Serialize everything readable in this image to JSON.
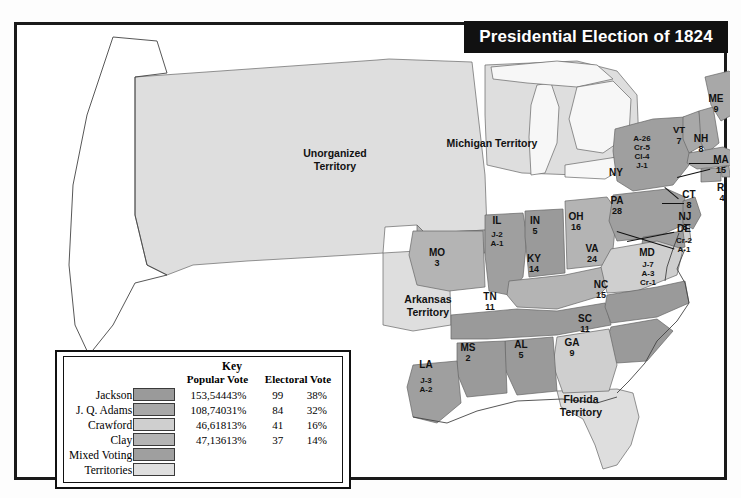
{
  "running_head": "",
  "map": {
    "title": "Presidential Election of 1824",
    "territories": [
      {
        "name": "Unorganized\nTerritory",
        "line1": "Unorganized",
        "line2": "Territory"
      },
      {
        "name": "Michigan Territory",
        "line1": "Michigan Territory",
        "line2": ""
      },
      {
        "name": "Arkansas Territory",
        "line1": "Arkansas",
        "line2": "Territory"
      },
      {
        "name": "Florida Territory",
        "line1": "Florida",
        "line2": "Territory"
      }
    ],
    "states": [
      {
        "abbr": "ME",
        "electoral": "9",
        "breakdown": []
      },
      {
        "abbr": "VT",
        "electoral": "7",
        "breakdown": []
      },
      {
        "abbr": "NH",
        "electoral": "8",
        "breakdown": []
      },
      {
        "abbr": "MA",
        "electoral": "15",
        "breakdown": []
      },
      {
        "abbr": "RI",
        "electoral": "4",
        "breakdown": []
      },
      {
        "abbr": "CT",
        "electoral": "8",
        "breakdown": []
      },
      {
        "abbr": "NY",
        "electoral": "",
        "breakdown": [
          "A-26",
          "Cr-5",
          "Cl-4",
          "J-1"
        ]
      },
      {
        "abbr": "NJ",
        "electoral": "8",
        "breakdown": []
      },
      {
        "abbr": "PA",
        "electoral": "28",
        "breakdown": []
      },
      {
        "abbr": "DE",
        "electoral": "",
        "breakdown": [
          "Cr-2",
          "A-1"
        ]
      },
      {
        "abbr": "MD",
        "electoral": "",
        "breakdown": [
          "J-7",
          "A-3",
          "Cr-1"
        ]
      },
      {
        "abbr": "VA",
        "electoral": "24",
        "breakdown": []
      },
      {
        "abbr": "NC",
        "electoral": "15",
        "breakdown": []
      },
      {
        "abbr": "SC",
        "electoral": "11",
        "breakdown": []
      },
      {
        "abbr": "GA",
        "electoral": "9",
        "breakdown": []
      },
      {
        "abbr": "AL",
        "electoral": "5",
        "breakdown": []
      },
      {
        "abbr": "MS",
        "electoral": "2",
        "breakdown": []
      },
      {
        "abbr": "LA",
        "electoral": "",
        "breakdown": [
          "J-3",
          "A-2"
        ]
      },
      {
        "abbr": "TN",
        "electoral": "11",
        "breakdown": []
      },
      {
        "abbr": "KY",
        "electoral": "14",
        "breakdown": []
      },
      {
        "abbr": "OH",
        "electoral": "16",
        "breakdown": []
      },
      {
        "abbr": "IN",
        "electoral": "5",
        "breakdown": []
      },
      {
        "abbr": "IL",
        "electoral": "",
        "breakdown": [
          "J-2",
          "A-1"
        ]
      },
      {
        "abbr": "MO",
        "electoral": "3",
        "breakdown": []
      }
    ]
  },
  "key": {
    "title": "Key",
    "col_popular": "Popular Vote",
    "col_electoral": "Electoral Vote",
    "rows": [
      {
        "name": "Jackson",
        "color": "#9a9a9a",
        "popular": "153,544",
        "popular_pct": "43%",
        "electoral": "99",
        "electoral_pct": "38%"
      },
      {
        "name": "J. Q. Adams",
        "color": "#a8a8a8",
        "popular": "108,740",
        "popular_pct": "31%",
        "electoral": "84",
        "electoral_pct": "32%"
      },
      {
        "name": "Crawford",
        "color": "#cfcfcf",
        "popular": "46,618",
        "popular_pct": "13%",
        "electoral": "41",
        "electoral_pct": "16%"
      },
      {
        "name": "Clay",
        "color": "#b4b4b4",
        "popular": "47,136",
        "popular_pct": "13%",
        "electoral": "37",
        "electoral_pct": "14%"
      },
      {
        "name": "Mixed Voting",
        "color": "#9f9f9f",
        "popular": "",
        "popular_pct": "",
        "electoral": "",
        "electoral_pct": ""
      },
      {
        "name": "Territories",
        "color": "#dedede",
        "popular": "",
        "popular_pct": "",
        "electoral": "",
        "electoral_pct": ""
      }
    ]
  },
  "colors": {
    "jackson": "#9a9a9a",
    "adams": "#a8a8a8",
    "crawford": "#cfcfcf",
    "clay": "#b4b4b4",
    "mixed": "#9f9f9f",
    "territory": "#dedede",
    "water": "#f2f2f2",
    "outline": "#555555",
    "banner_bg": "#111111"
  }
}
